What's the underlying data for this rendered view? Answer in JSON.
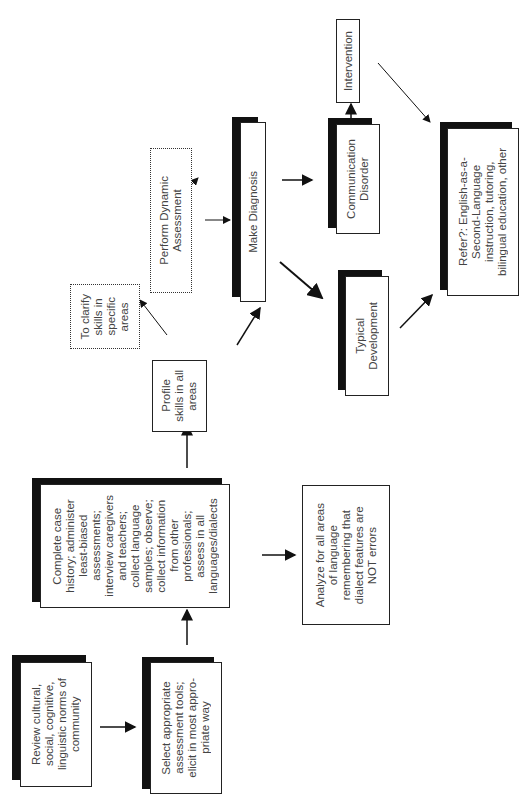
{
  "diagram": {
    "orientation": "rotated-90-ccw",
    "nodes": {
      "review": {
        "label": "Review cultural,\nsocial, cognitive,\nlinguistic norms of\ncommunity"
      },
      "select": {
        "label": "Select appropriate\nassessment tools;\nelicit in most appro-\npriate way"
      },
      "complete": {
        "label": "Complete case\nhistory; administer\nleast-biased\nassessments;\ninterview caregivers\nand teachers;\ncollect language\nsamples; observe;\ncollect information\nfrom other\nprofessionals;\nassess in all\nlanguages/dialects"
      },
      "analyze": {
        "label": "Analyze for all areas\nof language\nremembering that\ndialect features are\nNOT errors"
      },
      "profile": {
        "label": "Profile\nskills in all\nareas"
      },
      "clarify": {
        "label": "To clarify\nskills in\nspecific\nareas"
      },
      "dynamic": {
        "label": "Perform Dynamic\nAssessment"
      },
      "diagnosis": {
        "label": "Make Diagnosis"
      },
      "typical": {
        "label": "Typical\nDevelopment"
      },
      "disorder": {
        "label": "Communication\nDisorder"
      },
      "intervention": {
        "label": "Intervention"
      },
      "refer": {
        "label": "Refer?: English-as-a-\nSecond-Language\ninstruction, tutoring,\nbilingual education, other"
      }
    },
    "edges": [
      {
        "from": "review",
        "to": "select"
      },
      {
        "from": "select",
        "to": "complete"
      },
      {
        "from": "complete",
        "to": "analyze"
      },
      {
        "from": "complete",
        "to": "profile"
      },
      {
        "from": "profile",
        "to": "clarify"
      },
      {
        "from": "profile",
        "to": "diagnosis"
      },
      {
        "from": "clarify",
        "to": "dynamic"
      },
      {
        "from": "dynamic",
        "to": "diagnosis"
      },
      {
        "from": "diagnosis",
        "to": "disorder"
      },
      {
        "from": "diagnosis",
        "to": "typical"
      },
      {
        "from": "disorder",
        "to": "intervention"
      },
      {
        "from": "typical",
        "to": "refer"
      },
      {
        "from": "intervention",
        "to": "refer"
      }
    ]
  }
}
